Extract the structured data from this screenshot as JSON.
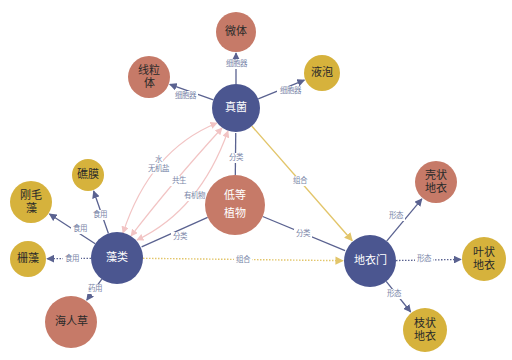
{
  "colors": {
    "navy": "#4b5690",
    "terracotta": "#c67a68",
    "gold": "#d6b23c",
    "edge_navy": "#5a6290",
    "edge_gold": "#e2c56a",
    "edge_pink": "#f2c4c4",
    "label": "#7a86a8",
    "text_dark": "#2a2a2a",
    "text_light": "#ffffff"
  },
  "nodes": [
    {
      "id": "zhenjun",
      "lines": [
        "真菌"
      ],
      "x": 236,
      "y": 108,
      "r": 24,
      "fill": "navy",
      "text": "text_light",
      "fs": 11
    },
    {
      "id": "weiti",
      "lines": [
        "微体"
      ],
      "x": 236,
      "y": 32,
      "r": 20,
      "fill": "terracotta",
      "text": "text_dark",
      "fs": 10
    },
    {
      "id": "xianliti",
      "lines": [
        "线粒",
        "体"
      ],
      "x": 149,
      "y": 77,
      "r": 21,
      "fill": "terracotta",
      "text": "text_dark",
      "fs": 10
    },
    {
      "id": "yepao",
      "lines": [
        "液泡"
      ],
      "x": 322,
      "y": 73,
      "r": 18,
      "fill": "gold",
      "text": "text_dark",
      "fs": 10
    },
    {
      "id": "didengzhiwu",
      "lines": [
        "低等",
        "植物"
      ],
      "x": 235,
      "y": 205,
      "r": 30,
      "fill": "terracotta",
      "text": "text_light",
      "fs": 15
    },
    {
      "id": "zaolei",
      "lines": [
        "藻类"
      ],
      "x": 117,
      "y": 258,
      "r": 26,
      "fill": "navy",
      "text": "text_light",
      "fs": 11
    },
    {
      "id": "jiaomo",
      "lines": [
        "礁膜"
      ],
      "x": 88,
      "y": 175,
      "r": 16,
      "fill": "gold",
      "text": "text_dark",
      "fs": 10
    },
    {
      "id": "gangmaozao",
      "lines": [
        "刚毛",
        "藻"
      ],
      "x": 31,
      "y": 202,
      "r": 21,
      "fill": "gold",
      "text": "text_dark",
      "fs": 10
    },
    {
      "id": "pengzao",
      "lines": [
        "栅藻"
      ],
      "x": 28,
      "y": 259,
      "r": 18,
      "fill": "gold",
      "text": "text_dark",
      "fs": 10
    },
    {
      "id": "hairencao",
      "lines": [
        "海人草"
      ],
      "x": 71,
      "y": 322,
      "r": 26,
      "fill": "terracotta",
      "text": "text_dark",
      "fs": 10
    },
    {
      "id": "diyimen",
      "lines": [
        "地衣门"
      ],
      "x": 370,
      "y": 261,
      "r": 26,
      "fill": "navy",
      "text": "text_light",
      "fs": 11
    },
    {
      "id": "kezhuang",
      "lines": [
        "壳状",
        "地衣"
      ],
      "x": 436,
      "y": 182,
      "r": 21,
      "fill": "terracotta",
      "text": "text_dark",
      "fs": 10
    },
    {
      "id": "yezhuang",
      "lines": [
        "叶状",
        "地衣"
      ],
      "x": 484,
      "y": 259,
      "r": 22,
      "fill": "gold",
      "text": "text_dark",
      "fs": 10
    },
    {
      "id": "zhizhuang",
      "lines": [
        "枝状",
        "地衣"
      ],
      "x": 425,
      "y": 330,
      "r": 22,
      "fill": "gold",
      "text": "text_dark",
      "fs": 10
    }
  ],
  "edges": [
    {
      "from": "zhenjun",
      "to": "weiti",
      "label": "细胞器",
      "color": "edge_navy",
      "style": "solid",
      "arrow": "end",
      "lx": 236,
      "ly": 64
    },
    {
      "from": "zhenjun",
      "to": "xianliti",
      "label": "细胞器",
      "color": "edge_navy",
      "style": "solid",
      "arrow": "end",
      "lx": 185,
      "ly": 96
    },
    {
      "from": "zhenjun",
      "to": "yepao",
      "label": "细胞器",
      "color": "edge_navy",
      "style": "solid",
      "arrow": "end",
      "lx": 290,
      "ly": 91
    },
    {
      "from": "didengzhiwu",
      "to": "zhenjun",
      "label": "分类",
      "color": "edge_navy",
      "style": "solid",
      "arrow": "none",
      "lx": 236,
      "ly": 158
    },
    {
      "from": "didengzhiwu",
      "to": "zaolei",
      "label": "分类",
      "color": "edge_navy",
      "style": "solid",
      "arrow": "none",
      "lx": 180,
      "ly": 237
    },
    {
      "from": "didengzhiwu",
      "to": "diyimen",
      "label": "分类",
      "color": "edge_navy",
      "style": "solid",
      "arrow": "none",
      "lx": 303,
      "ly": 234
    },
    {
      "from": "zhenjun",
      "to": "diyimen",
      "label": "组合",
      "color": "edge_gold",
      "style": "solid",
      "arrow": "end",
      "lx": 300,
      "ly": 181
    },
    {
      "from": "zaolei",
      "to": "diyimen",
      "label": "组合",
      "color": "edge_gold",
      "style": "dotted",
      "arrow": "end",
      "lx": 243,
      "ly": 260
    },
    {
      "from": "zaolei",
      "to": "jiaomo",
      "label": "食用",
      "color": "edge_navy",
      "style": "solid",
      "arrow": "end",
      "lx": 100,
      "ly": 215
    },
    {
      "from": "zaolei",
      "to": "gangmaozao",
      "label": "食用",
      "color": "edge_navy",
      "style": "solid",
      "arrow": "end",
      "lx": 80,
      "ly": 229
    },
    {
      "from": "zaolei",
      "to": "pengzao",
      "label": "食用",
      "color": "edge_navy",
      "style": "dotted",
      "arrow": "end",
      "lx": 72,
      "ly": 259
    },
    {
      "from": "zaolei",
      "to": "hairencao",
      "label": "药用",
      "color": "edge_navy",
      "style": "solid",
      "arrow": "end",
      "lx": 95,
      "ly": 289
    },
    {
      "from": "diyimen",
      "to": "kezhuang",
      "label": "形态",
      "color": "edge_navy",
      "style": "solid",
      "arrow": "end",
      "lx": 396,
      "ly": 216
    },
    {
      "from": "diyimen",
      "to": "yezhuang",
      "label": "形态",
      "color": "edge_navy",
      "style": "dotted",
      "arrow": "end",
      "lx": 424,
      "ly": 259
    },
    {
      "from": "diyimen",
      "to": "zhizhuang",
      "label": "形态",
      "color": "edge_navy",
      "style": "solid",
      "arrow": "end",
      "lx": 394,
      "ly": 294
    }
  ],
  "curved_edges": [
    {
      "from": "zhenjun",
      "to": "zaolei",
      "path": "M217,123 Q150,150 123,233",
      "label_lines": [
        "水",
        "无机盐"
      ],
      "lx": 158,
      "ly": 164,
      "arrow": "both"
    },
    {
      "from": "zhenjun",
      "to": "zaolei",
      "path": "M222,128 Q170,185 131,236",
      "label_lines": [
        "共生"
      ],
      "lx": 179,
      "ly": 181,
      "arrow": "both"
    },
    {
      "from": "zhenjun",
      "to": "zaolei",
      "path": "M228,131 Q200,210 137,240",
      "label_lines": [
        "有机物"
      ],
      "lx": 194,
      "ly": 196,
      "arrow": "both"
    }
  ]
}
